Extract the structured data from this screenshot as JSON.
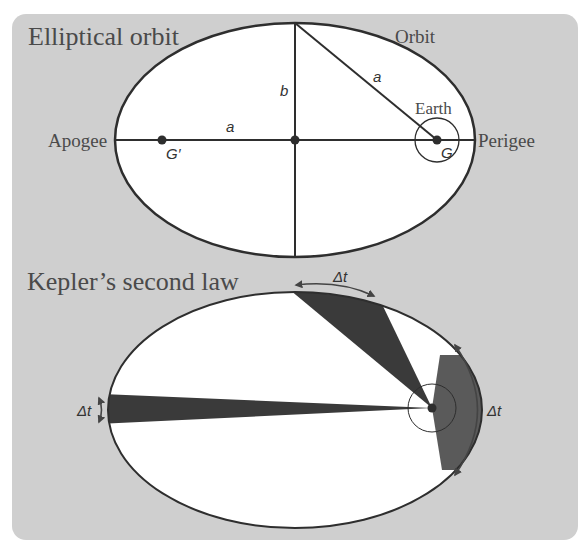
{
  "figure": {
    "panel_color": "#cfcfcf",
    "line_color": "#2e2e2e",
    "sector_color": "#3a3a3a",
    "sector_light_color": "#5a5a5a"
  },
  "elliptical_orbit": {
    "title": "Elliptical orbit",
    "orbit_label": "Orbit",
    "earth_label": "Earth",
    "apogee_label": "Apogee",
    "perigee_label": "Perigee",
    "semi_major_label": "a",
    "semi_major_label_diag": "a",
    "semi_minor_label": "b",
    "focus_label": "G",
    "empty_focus_label": "G′"
  },
  "keplers_second_law": {
    "title": "Kepler’s second law",
    "top_interval_label": "Δt",
    "left_interval_label": "Δt",
    "right_interval_label": "Δt"
  }
}
